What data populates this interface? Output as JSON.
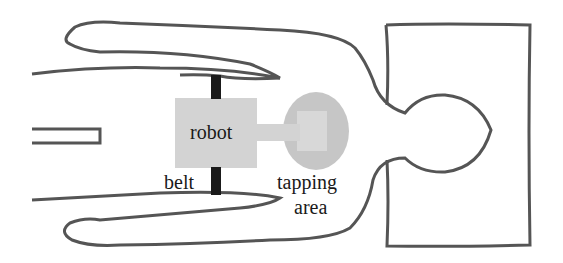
{
  "diagram": {
    "labels": {
      "robot": "robot",
      "belt": "belt",
      "tapping_line1": "tapping",
      "tapping_line2": "area"
    },
    "colors": {
      "outline": "#555555",
      "robot_fill": "#d3d3d3",
      "belt": "#1a1a1a",
      "tapping_area": "#c6c6c6",
      "tapping_inner": "#d8d8d8"
    }
  }
}
